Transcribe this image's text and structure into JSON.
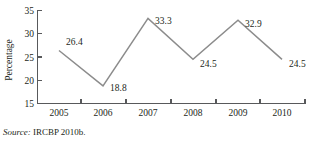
{
  "chart_data": {
    "type": "line",
    "title": "",
    "subtitle": "",
    "xlabel": "",
    "ylabel": "Percentage",
    "categories": [
      "2005",
      "2006",
      "2007",
      "2008",
      "2009",
      "2010"
    ],
    "values": [
      26.4,
      18.8,
      33.3,
      24.5,
      32.9,
      24.5
    ],
    "point_labels": [
      "26.4",
      "18.8",
      "33.3",
      "24.5",
      "32.9",
      "24.5"
    ],
    "series": [
      {
        "name": "Percentage",
        "values": [
          26.4,
          18.8,
          33.3,
          24.5,
          32.9,
          24.5
        ]
      }
    ],
    "ylim": [
      15,
      35
    ],
    "yticks": [
      15,
      20,
      25,
      30,
      35
    ],
    "ytick_labels": [
      "15",
      "20",
      "25",
      "30",
      "35"
    ],
    "xtick_labels": [
      "2005",
      "2006",
      "2007",
      "2008",
      "2009",
      "2010"
    ],
    "grid": false,
    "legend": false,
    "legend_position": "none",
    "line_color": "#8c8c8c",
    "axis_color": "#58595b",
    "text_color": "#231f20",
    "background": "#ffffff",
    "annotations": []
  },
  "caption": {
    "source_lead": "Source:",
    "source_body": " IRCBP 2010b."
  }
}
